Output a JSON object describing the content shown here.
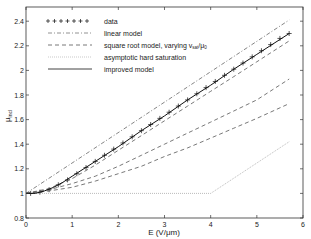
{
  "chart_data": {
    "type": "line",
    "title": "",
    "xlabel": "E (V/μm)",
    "ylabel": "μ",
    "ylabel_sub": "incl",
    "xlim": [
      0,
      6
    ],
    "ylim": [
      0.8,
      2.5
    ],
    "xticks": [
      0,
      1,
      2,
      3,
      4,
      5,
      6
    ],
    "yticks": [
      0.8,
      1,
      1.2,
      1.4,
      1.6,
      1.8,
      2,
      2.2,
      2.4
    ],
    "xtick_labels": [
      "0",
      "1",
      "2",
      "3",
      "4",
      "5",
      "6"
    ],
    "ytick_labels": [
      "0.8",
      "1",
      "1.2",
      "1.4",
      "1.6",
      "1.8",
      "2",
      "2.2",
      "2.4"
    ],
    "grid": false,
    "legend_position": "upper left",
    "legend": [
      {
        "label": "data",
        "style": "plus-markers"
      },
      {
        "label": "linear model",
        "style": "dash-dot"
      },
      {
        "label": "square root model, varying v",
        "sub": "sat",
        "suffix": "/μ",
        "sub2": "0",
        "style": "dashed"
      },
      {
        "label": "asymptotic hard saturation",
        "style": "dotted"
      },
      {
        "label": "improved model",
        "style": "solid"
      }
    ],
    "series": [
      {
        "name": "data",
        "x": [
          0.1,
          0.3,
          0.5,
          0.7,
          0.9,
          1.1,
          1.3,
          1.5,
          1.7,
          1.9,
          2.1,
          2.3,
          2.5,
          2.7,
          2.9,
          3.1,
          3.3,
          3.5,
          3.7,
          3.9,
          4.1,
          4.3,
          4.5,
          4.7,
          4.9,
          5.1,
          5.3,
          5.5,
          5.7
        ],
        "y": [
          1.0,
          1.01,
          1.03,
          1.07,
          1.11,
          1.16,
          1.21,
          1.26,
          1.31,
          1.36,
          1.41,
          1.46,
          1.51,
          1.56,
          1.61,
          1.66,
          1.71,
          1.76,
          1.81,
          1.86,
          1.91,
          1.96,
          2.01,
          2.06,
          2.11,
          2.16,
          2.21,
          2.26,
          2.3
        ]
      },
      {
        "name": "linear model",
        "x": [
          0,
          5.7
        ],
        "y": [
          1.0,
          2.41
        ]
      },
      {
        "name": "square root model 1",
        "x": [
          0,
          0.5,
          1,
          1.5,
          2,
          2.5,
          3,
          3.5,
          4,
          4.5,
          5,
          5.7
        ],
        "y": [
          1.0,
          1.04,
          1.12,
          1.23,
          1.35,
          1.47,
          1.59,
          1.71,
          1.83,
          1.95,
          2.07,
          2.24
        ]
      },
      {
        "name": "square root model 2",
        "x": [
          0,
          0.5,
          1,
          1.5,
          2,
          2.5,
          3,
          3.5,
          4,
          4.5,
          5,
          5.7
        ],
        "y": [
          1.0,
          1.03,
          1.08,
          1.14,
          1.22,
          1.31,
          1.4,
          1.49,
          1.58,
          1.67,
          1.76,
          1.93
        ]
      },
      {
        "name": "square root model 3",
        "x": [
          0,
          0.5,
          1,
          1.5,
          2,
          2.5,
          3,
          3.5,
          4,
          4.5,
          5,
          5.7
        ],
        "y": [
          1.0,
          1.02,
          1.05,
          1.1,
          1.16,
          1.22,
          1.3,
          1.37,
          1.45,
          1.53,
          1.61,
          1.73
        ]
      },
      {
        "name": "asymptotic hard saturation",
        "x": [
          0,
          4.0,
          5.7
        ],
        "y": [
          1.0,
          1.0,
          1.42
        ]
      },
      {
        "name": "improved model",
        "x": [
          0,
          0.2,
          0.4,
          0.6,
          0.8,
          1,
          1.5,
          2,
          2.5,
          3,
          3.5,
          4,
          4.5,
          5,
          5.7
        ],
        "y": [
          1.0,
          1.0,
          1.02,
          1.05,
          1.09,
          1.14,
          1.26,
          1.38,
          1.51,
          1.63,
          1.76,
          1.88,
          2.01,
          2.13,
          2.3
        ]
      }
    ]
  }
}
